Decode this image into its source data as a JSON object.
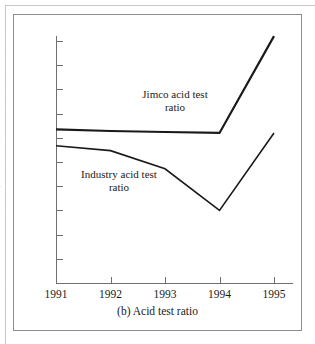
{
  "figure": {
    "caption": "(b) Acid test ratio"
  },
  "chart_data": {
    "type": "line",
    "title": "(b) Acid test ratio",
    "xlabel": "",
    "ylabel": "",
    "x": [
      "1991",
      "1992",
      "1993",
      "1994",
      "1995"
    ],
    "categories": [
      "1991",
      "1992",
      "1993",
      "1994",
      "1995"
    ],
    "xticklabels": [
      "1991",
      "1992",
      "1993",
      "1994",
      "1995"
    ],
    "yticklabels": [
      "0",
      "0.1",
      "0.2",
      "0.3",
      "0.4",
      "0.5",
      "0.6",
      "0.7",
      "0.8",
      "0.9",
      "1.0"
    ],
    "ytickvalues": [
      0,
      0.1,
      0.2,
      0.3,
      0.4,
      0.5,
      0.6,
      0.7,
      0.8,
      0.9,
      1.0
    ],
    "ylim": [
      0,
      1.05
    ],
    "grid": false,
    "legend": "inline-annotations",
    "series": [
      {
        "name": "Jimco acid test ratio",
        "label_line1": "Jimco acid test",
        "label_line2": "ratio",
        "values": [
          0.635,
          0.628,
          0.624,
          0.62,
          1.02
        ],
        "color": "#1a1a1a",
        "linewidth": 2.2
      },
      {
        "name": "Industry acid test ratio",
        "label_line1": "Industry acid test",
        "label_line2": "ratio",
        "values": [
          0.567,
          0.547,
          0.472,
          0.3,
          0.62
        ],
        "color": "#1a1a1a",
        "linewidth": 1.6
      }
    ]
  }
}
